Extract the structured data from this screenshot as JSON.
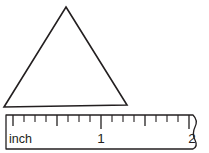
{
  "figure": {
    "background_color": "#ffffff",
    "ink_color": "#231f20",
    "width": 209,
    "height": 153
  },
  "triangle": {
    "name": "triangle",
    "apex": {
      "x": 66,
      "y": 7
    },
    "base_left": {
      "x": 4,
      "y": 107
    },
    "base_right": {
      "x": 127,
      "y": 105
    },
    "points": "66,7 127,105 4,107",
    "stroke_color": "#231f20",
    "fill": "none"
  },
  "ruler": {
    "name": "inch-ruler",
    "unit_label": "inch",
    "box": {
      "x": 5,
      "y": 114,
      "width": 195,
      "height": 36
    },
    "torn_right_edge": true,
    "path": "M6,115 L193,115 C197,119 197,123 195,127 C193,131 193,136 195,140 C197,144 197,147 193,149 L6,149 Z",
    "ticks": [
      {
        "value": 0.0,
        "x": 13,
        "height": 11,
        "major": true
      },
      {
        "value": 0.125,
        "x": 24,
        "height": 7,
        "major": false
      },
      {
        "value": 0.25,
        "x": 35,
        "height": 7,
        "major": false
      },
      {
        "value": 0.375,
        "x": 46,
        "height": 7,
        "major": false
      },
      {
        "value": 0.5,
        "x": 57,
        "height": 11,
        "major": true
      },
      {
        "value": 0.625,
        "x": 68,
        "height": 7,
        "major": false
      },
      {
        "value": 0.75,
        "x": 79,
        "height": 7,
        "major": false
      },
      {
        "value": 0.875,
        "x": 90,
        "height": 7,
        "major": false
      },
      {
        "value": 1.0,
        "x": 101,
        "height": 14,
        "major": true
      },
      {
        "value": 1.125,
        "x": 112,
        "height": 7,
        "major": false
      },
      {
        "value": 1.25,
        "x": 123,
        "height": 7,
        "major": false
      },
      {
        "value": 1.375,
        "x": 134,
        "height": 7,
        "major": false
      },
      {
        "value": 1.5,
        "x": 145,
        "height": 11,
        "major": true
      },
      {
        "value": 1.625,
        "x": 156,
        "height": 7,
        "major": false
      },
      {
        "value": 1.75,
        "x": 167,
        "height": 7,
        "major": false
      },
      {
        "value": 1.875,
        "x": 178,
        "height": 7,
        "major": false
      },
      {
        "value": 2.0,
        "x": 189,
        "height": 14,
        "major": true
      }
    ],
    "labels": [
      {
        "text": "inch",
        "x": 9,
        "y": 143,
        "anchor": "start"
      },
      {
        "text": "1",
        "x": 101,
        "y": 143,
        "anchor": "middle"
      },
      {
        "text": "2",
        "x": 192,
        "y": 143,
        "anchor": "middle"
      }
    ]
  }
}
